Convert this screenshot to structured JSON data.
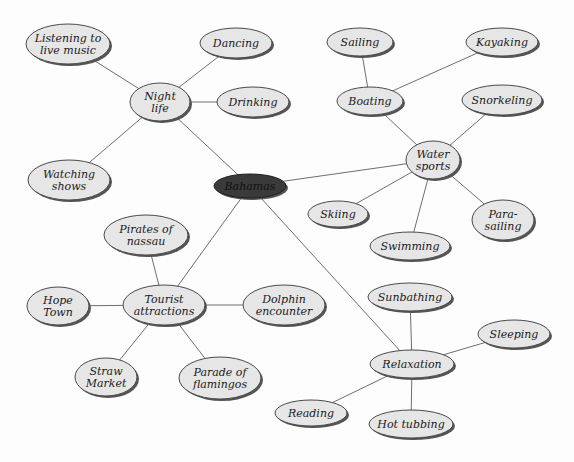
{
  "diagram": {
    "type": "mind-map",
    "colors": {
      "node_fill": "#e6e6e6",
      "node_border": "#4a4a4a",
      "center_fill": "#3a3a3a",
      "edge": "#6e6e6e"
    },
    "center": {
      "id": "bahamas",
      "label": [
        "Bahamas"
      ],
      "x": 250,
      "y": 186,
      "rx": 36,
      "ry": 12
    },
    "nodes": [
      {
        "id": "night-life",
        "label": [
          "Night",
          "life"
        ],
        "x": 160,
        "y": 102,
        "rx": 30,
        "ry": 19
      },
      {
        "id": "listening",
        "label": [
          "Listening to",
          "live music"
        ],
        "x": 68,
        "y": 44,
        "rx": 42,
        "ry": 20
      },
      {
        "id": "dancing",
        "label": [
          "Dancing"
        ],
        "x": 236,
        "y": 43,
        "rx": 36,
        "ry": 15
      },
      {
        "id": "drinking",
        "label": [
          "Drinking"
        ],
        "x": 253,
        "y": 102,
        "rx": 36,
        "ry": 15
      },
      {
        "id": "watching",
        "label": [
          "Watching",
          "shows"
        ],
        "x": 69,
        "y": 180,
        "rx": 41,
        "ry": 20
      },
      {
        "id": "water-sports",
        "label": [
          "Water",
          "sports"
        ],
        "x": 433,
        "y": 160,
        "rx": 27,
        "ry": 19
      },
      {
        "id": "boating",
        "label": [
          "Boating"
        ],
        "x": 370,
        "y": 101,
        "rx": 33,
        "ry": 14
      },
      {
        "id": "sailing",
        "label": [
          "Sailing"
        ],
        "x": 360,
        "y": 42,
        "rx": 33,
        "ry": 14
      },
      {
        "id": "kayaking",
        "label": [
          "Kayaking"
        ],
        "x": 502,
        "y": 42,
        "rx": 36,
        "ry": 14
      },
      {
        "id": "snorkeling",
        "label": [
          "Snorkeling"
        ],
        "x": 502,
        "y": 100,
        "rx": 40,
        "ry": 15
      },
      {
        "id": "skiing",
        "label": [
          "Skiing"
        ],
        "x": 338,
        "y": 214,
        "rx": 30,
        "ry": 13
      },
      {
        "id": "swimming",
        "label": [
          "Swimming"
        ],
        "x": 410,
        "y": 246,
        "rx": 40,
        "ry": 14
      },
      {
        "id": "parasailing",
        "label": [
          "Para-",
          "sailing"
        ],
        "x": 503,
        "y": 220,
        "rx": 31,
        "ry": 20
      },
      {
        "id": "tourist",
        "label": [
          "Tourist",
          "attractions"
        ],
        "x": 164,
        "y": 305,
        "rx": 41,
        "ry": 20
      },
      {
        "id": "pirates",
        "label": [
          "Pirates of",
          "nassau"
        ],
        "x": 146,
        "y": 235,
        "rx": 42,
        "ry": 20
      },
      {
        "id": "hope-town",
        "label": [
          "Hope",
          "Town"
        ],
        "x": 58,
        "y": 306,
        "rx": 31,
        "ry": 19
      },
      {
        "id": "dolphin",
        "label": [
          "Dolphin",
          "encounter"
        ],
        "x": 284,
        "y": 305,
        "rx": 41,
        "ry": 20
      },
      {
        "id": "straw-market",
        "label": [
          "Straw",
          "Market"
        ],
        "x": 106,
        "y": 377,
        "rx": 31,
        "ry": 19
      },
      {
        "id": "parade",
        "label": [
          "Parade of",
          "flamingos"
        ],
        "x": 220,
        "y": 378,
        "rx": 41,
        "ry": 21
      },
      {
        "id": "relaxation",
        "label": [
          "Relaxation"
        ],
        "x": 412,
        "y": 364,
        "rx": 42,
        "ry": 14
      },
      {
        "id": "sunbathing",
        "label": [
          "Sunbathing"
        ],
        "x": 410,
        "y": 297,
        "rx": 42,
        "ry": 14
      },
      {
        "id": "sleeping",
        "label": [
          "Sleeping"
        ],
        "x": 514,
        "y": 334,
        "rx": 36,
        "ry": 14
      },
      {
        "id": "reading",
        "label": [
          "Reading"
        ],
        "x": 311,
        "y": 413,
        "rx": 36,
        "ry": 13
      },
      {
        "id": "hot-tubbing",
        "label": [
          "Hot tubbing"
        ],
        "x": 411,
        "y": 424,
        "rx": 42,
        "ry": 14
      }
    ],
    "edges": [
      [
        "bahamas",
        "night-life"
      ],
      [
        "bahamas",
        "water-sports"
      ],
      [
        "bahamas",
        "tourist"
      ],
      [
        "bahamas",
        "relaxation"
      ],
      [
        "night-life",
        "listening"
      ],
      [
        "night-life",
        "dancing"
      ],
      [
        "night-life",
        "drinking"
      ],
      [
        "night-life",
        "watching"
      ],
      [
        "water-sports",
        "boating"
      ],
      [
        "boating",
        "sailing"
      ],
      [
        "boating",
        "kayaking"
      ],
      [
        "water-sports",
        "snorkeling"
      ],
      [
        "water-sports",
        "skiing"
      ],
      [
        "water-sports",
        "swimming"
      ],
      [
        "water-sports",
        "parasailing"
      ],
      [
        "tourist",
        "pirates"
      ],
      [
        "tourist",
        "hope-town"
      ],
      [
        "tourist",
        "dolphin"
      ],
      [
        "tourist",
        "straw-market"
      ],
      [
        "tourist",
        "parade"
      ],
      [
        "relaxation",
        "sunbathing"
      ],
      [
        "relaxation",
        "sleeping"
      ],
      [
        "relaxation",
        "reading"
      ],
      [
        "relaxation",
        "hot-tubbing"
      ]
    ]
  }
}
